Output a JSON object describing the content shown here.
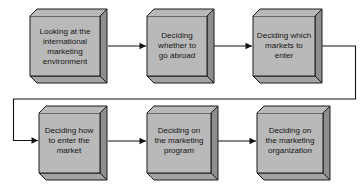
{
  "diagram": {
    "type": "process-flow",
    "background_color": "#ffffff",
    "box_face_color": "#b9b9b9",
    "box_side_color": "#8e8e8e",
    "box_bottom_color": "#a3a3a3",
    "box_border_color": "#1a1a1a",
    "connector_color": "#111111",
    "nodes": [
      {
        "id": "node-1",
        "order": "1",
        "lines": [
          "Looking at the",
          "international",
          "marketing",
          "environment"
        ],
        "row": "top",
        "column": "1"
      },
      {
        "id": "node-2",
        "order": "2",
        "lines": [
          "Deciding",
          "whether to",
          "go abroad"
        ],
        "row": "top",
        "column": "2"
      },
      {
        "id": "node-3",
        "order": "3",
        "lines": [
          "Deciding which",
          "markets to",
          "enter"
        ],
        "row": "top",
        "column": "3"
      },
      {
        "id": "node-4",
        "order": "4",
        "lines": [
          "Deciding how",
          "to enter the",
          "market"
        ],
        "row": "bottom",
        "column": "1"
      },
      {
        "id": "node-5",
        "order": "5",
        "lines": [
          "Deciding on",
          "the marketing",
          "program"
        ],
        "row": "bottom",
        "column": "2"
      },
      {
        "id": "node-6",
        "order": "6",
        "lines": [
          "Deciding on",
          "the marketing",
          "organization"
        ],
        "row": "bottom",
        "column": "3"
      }
    ],
    "connectors": [
      {
        "id": "connector-1-2",
        "from": "node-1",
        "to": "node-2",
        "shape": "straight-right"
      },
      {
        "id": "connector-2-3",
        "from": "node-2",
        "to": "node-3",
        "shape": "straight-right"
      },
      {
        "id": "connector-3-4",
        "from": "node-3",
        "to": "node-4",
        "shape": "wrap-around-right-down-left-down"
      },
      {
        "id": "connector-4-5",
        "from": "node-4",
        "to": "node-5",
        "shape": "straight-right"
      },
      {
        "id": "connector-5-6",
        "from": "node-5",
        "to": "node-6",
        "shape": "straight-right"
      }
    ]
  }
}
